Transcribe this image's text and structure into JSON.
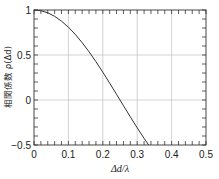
{
  "chart_data": {
    "type": "line",
    "title": "",
    "xlabel": "Δd/λ",
    "ylabel": "相関係数 ρ(Δd)",
    "xlim": [
      0,
      0.5
    ],
    "ylim": [
      -0.5,
      1
    ],
    "xticks": [
      0,
      0.1,
      0.2,
      0.3,
      0.4,
      0.5
    ],
    "xtick_labels": [
      "0",
      "0.1",
      "0.2",
      "0.3",
      "0.4",
      "0.5"
    ],
    "yticks": [
      -0.5,
      0,
      0.5,
      1
    ],
    "ytick_labels": [
      "−0.5",
      "0",
      "0.5",
      "1"
    ],
    "x_minor_step": 0.02,
    "y_minor_step": 0.1,
    "grid": true,
    "legend": null,
    "series": [
      {
        "name": "ρ(Δd)",
        "color": "#333333",
        "x": [
          0,
          0.02,
          0.04,
          0.06,
          0.08,
          0.1,
          0.12,
          0.14,
          0.16,
          0.18,
          0.2,
          0.22,
          0.24,
          0.26,
          0.28,
          0.3,
          0.32,
          0.3333
        ],
        "y": [
          1.0,
          0.992,
          0.969,
          0.93,
          0.876,
          0.809,
          0.729,
          0.637,
          0.536,
          0.426,
          0.309,
          0.187,
          0.063,
          -0.063,
          -0.187,
          -0.309,
          -0.426,
          -0.5
        ]
      }
    ]
  },
  "axes": {
    "x_title_main": "Δd",
    "x_title_sep": "/",
    "x_title_den": "λ",
    "y_title_prefix": "相関係数",
    "y_title_func": "ρ(Δd)"
  }
}
